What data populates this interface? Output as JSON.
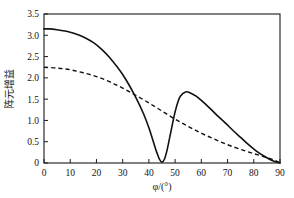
{
  "chart_data": {
    "type": "line",
    "title": "",
    "xlabel": "φ/(°)",
    "ylabel": "阵元增益",
    "xlim": [
      0,
      90
    ],
    "ylim": [
      0,
      3.5
    ],
    "grid": false,
    "legend": "none",
    "xticks": [
      0,
      10,
      20,
      30,
      40,
      50,
      60,
      70,
      80,
      90
    ],
    "xtick_labels": [
      "0",
      "10",
      "20",
      "30",
      "40",
      "50",
      "60",
      "70",
      "80",
      "90"
    ],
    "yticks": [
      0,
      0.5,
      1.0,
      1.5,
      2.0,
      2.5,
      3.0,
      3.5
    ],
    "ytick_labels": [
      "0",
      "0.5",
      "1.0",
      "1.5",
      "2.0",
      "2.5",
      "3.0",
      "3.5"
    ],
    "series": [
      {
        "name": "solid-curve",
        "style": "solid",
        "color": "#111111",
        "x": [
          0,
          2,
          5,
          8,
          10,
          13,
          16,
          19,
          22,
          25,
          28,
          30,
          32,
          34,
          36,
          38,
          40,
          41,
          42,
          43,
          44,
          45,
          46,
          47,
          48,
          49,
          50,
          51,
          52,
          54,
          56,
          58,
          60,
          63,
          66,
          69,
          72,
          75,
          78,
          81,
          84,
          87,
          90
        ],
        "y": [
          3.15,
          3.15,
          3.13,
          3.1,
          3.07,
          3.01,
          2.93,
          2.82,
          2.67,
          2.48,
          2.25,
          2.08,
          1.88,
          1.66,
          1.42,
          1.15,
          0.83,
          0.64,
          0.44,
          0.25,
          0.09,
          0.02,
          0.1,
          0.32,
          0.62,
          0.92,
          1.2,
          1.42,
          1.57,
          1.67,
          1.64,
          1.57,
          1.47,
          1.3,
          1.12,
          0.95,
          0.77,
          0.6,
          0.43,
          0.28,
          0.16,
          0.06,
          0.0
        ]
      },
      {
        "name": "dashed-curve",
        "style": "dashed",
        "color": "#111111",
        "x": [
          0,
          5,
          10,
          15,
          20,
          25,
          30,
          35,
          40,
          45,
          50,
          55,
          60,
          65,
          70,
          75,
          80,
          85,
          88,
          90
        ],
        "y": [
          2.25,
          2.23,
          2.19,
          2.12,
          2.03,
          1.91,
          1.76,
          1.59,
          1.41,
          1.22,
          1.03,
          0.86,
          0.7,
          0.56,
          0.43,
          0.32,
          0.22,
          0.13,
          0.06,
          0.0
        ]
      }
    ],
    "annotations": {
      "solid_null_angle_deg": 45,
      "solid_null_value": 0.02,
      "solid_sidelobe_peak_angle_deg": 54,
      "solid_sidelobe_peak_value": 1.67,
      "solid_start_value": 3.15,
      "dashed_start_value": 2.25,
      "curves_cross_angle_deg": 40,
      "curves_cross_value": 1.41
    }
  }
}
